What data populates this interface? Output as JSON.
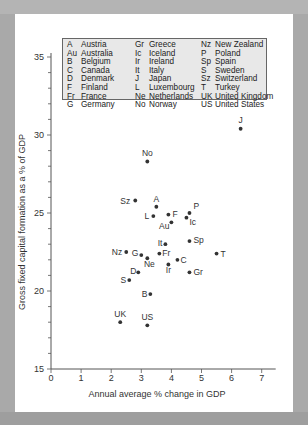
{
  "chart_data": {
    "type": "scatter",
    "title": "",
    "xlabel": "Annual average % change in GDP",
    "ylabel": "Gross fixed capital formation as a % of GDP",
    "xlim": [
      0,
      7
    ],
    "ylim": [
      15,
      35
    ],
    "x_ticks": [
      0,
      1,
      2,
      3,
      4,
      5,
      6,
      7
    ],
    "y_ticks": [
      15,
      20,
      25,
      30,
      35
    ],
    "grid": false,
    "legend_position": "top inside",
    "points": [
      {
        "label": "J",
        "x": 6.3,
        "y": 30.4
      },
      {
        "label": "No",
        "x": 3.2,
        "y": 28.3
      },
      {
        "label": "Sz",
        "x": 2.8,
        "y": 25.8
      },
      {
        "label": "A",
        "x": 3.5,
        "y": 25.4
      },
      {
        "label": "P",
        "x": 4.6,
        "y": 25.0
      },
      {
        "label": "L",
        "x": 3.4,
        "y": 24.8
      },
      {
        "label": "F",
        "x": 3.9,
        "y": 24.9
      },
      {
        "label": "Au",
        "x": 4.0,
        "y": 24.4
      },
      {
        "label": "Ic",
        "x": 4.5,
        "y": 24.7
      },
      {
        "label": "It",
        "x": 3.8,
        "y": 23.0
      },
      {
        "label": "Sp",
        "x": 4.6,
        "y": 23.2
      },
      {
        "label": "Nz",
        "x": 2.5,
        "y": 22.5
      },
      {
        "label": "T",
        "x": 5.5,
        "y": 22.4
      },
      {
        "label": "G",
        "x": 3.0,
        "y": 22.3
      },
      {
        "label": "Ne",
        "x": 3.2,
        "y": 22.1
      },
      {
        "label": "Fr",
        "x": 3.6,
        "y": 22.4
      },
      {
        "label": "C",
        "x": 4.2,
        "y": 22.0
      },
      {
        "label": "Ir",
        "x": 3.9,
        "y": 21.7
      },
      {
        "label": "D",
        "x": 2.9,
        "y": 21.2
      },
      {
        "label": "Gr",
        "x": 4.6,
        "y": 21.2
      },
      {
        "label": "S",
        "x": 2.6,
        "y": 20.7
      },
      {
        "label": "B",
        "x": 3.3,
        "y": 19.8
      },
      {
        "label": "UK",
        "x": 2.3,
        "y": 18.0
      },
      {
        "label": "US",
        "x": 3.2,
        "y": 17.8
      }
    ],
    "legend": [
      {
        "abbr": "A",
        "name": "Austria"
      },
      {
        "abbr": "Au",
        "name": "Australia"
      },
      {
        "abbr": "B",
        "name": "Belgium"
      },
      {
        "abbr": "C",
        "name": "Canada"
      },
      {
        "abbr": "D",
        "name": "Denmark"
      },
      {
        "abbr": "F",
        "name": "Finland"
      },
      {
        "abbr": "Fr",
        "name": "France"
      },
      {
        "abbr": "G",
        "name": "Germany"
      },
      {
        "abbr": "Gr",
        "name": "Greece"
      },
      {
        "abbr": "Ic",
        "name": "Iceland"
      },
      {
        "abbr": "Ir",
        "name": "Ireland"
      },
      {
        "abbr": "It",
        "name": "Italy"
      },
      {
        "abbr": "J",
        "name": "Japan"
      },
      {
        "abbr": "L",
        "name": "Luxembourg"
      },
      {
        "abbr": "Ne",
        "name": "Netherlands"
      },
      {
        "abbr": "No",
        "name": "Norway"
      },
      {
        "abbr": "Nz",
        "name": "New Zealand"
      },
      {
        "abbr": "P",
        "name": "Poland"
      },
      {
        "abbr": "Sp",
        "name": "Spain"
      },
      {
        "abbr": "S",
        "name": "Sweden"
      },
      {
        "abbr": "Sz",
        "name": "Switzerland"
      },
      {
        "abbr": "T",
        "name": "Turkey"
      },
      {
        "abbr": "UK",
        "name": "United Kingdom"
      },
      {
        "abbr": "US",
        "name": "United States"
      }
    ]
  },
  "colors": {
    "background": "#a9a9a9",
    "panel": "#ffffff",
    "legend_fill": "#e8e8e8",
    "point": "#333333",
    "axis": "#555555",
    "text": "#333333"
  }
}
